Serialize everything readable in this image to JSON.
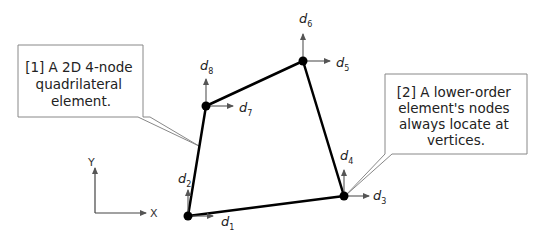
{
  "callouts": [
    {
      "id": 1,
      "lines": [
        "[1] A 2D 4-node",
        "quadrilateral",
        "element."
      ]
    },
    {
      "id": 2,
      "lines": [
        "[2] A lower-order",
        "element's nodes",
        "always locate at",
        "vertices."
      ]
    }
  ],
  "axes": {
    "x_label": "X",
    "y_label": "Y"
  },
  "dofs": [
    {
      "symbol": "d",
      "sub": "1"
    },
    {
      "symbol": "d",
      "sub": "2"
    },
    {
      "symbol": "d",
      "sub": "3"
    },
    {
      "symbol": "d",
      "sub": "4"
    },
    {
      "symbol": "d",
      "sub": "5"
    },
    {
      "symbol": "d",
      "sub": "6"
    },
    {
      "symbol": "d",
      "sub": "7"
    },
    {
      "symbol": "d",
      "sub": "8"
    }
  ],
  "colors": {
    "element_edge": "#000000",
    "arrow": "#555555",
    "callout_border": "#888888",
    "text": "#222222"
  }
}
